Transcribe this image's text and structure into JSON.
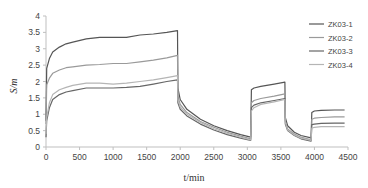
{
  "chart_data": {
    "type": "line",
    "title": "",
    "xlabel": "t/min",
    "ylabel": "S/m",
    "xlim": [
      0,
      4500
    ],
    "ylim": [
      0,
      4
    ],
    "xticks": [
      0,
      500,
      1000,
      1500,
      2000,
      2500,
      3000,
      3500,
      4000,
      4500
    ],
    "yticks": [
      0,
      0.5,
      1,
      1.5,
      2,
      2.5,
      3,
      3.5,
      4
    ],
    "grid": false,
    "legend_position": "right-top",
    "series": [
      {
        "name": "ZK03-1",
        "color": "#555555",
        "x": [
          0,
          10,
          50,
          100,
          200,
          300,
          400,
          600,
          800,
          1000,
          1200,
          1400,
          1600,
          1800,
          1960,
          1965,
          2000,
          2100,
          2300,
          2500,
          2700,
          2900,
          3050,
          3060,
          3100,
          3200,
          3400,
          3560,
          3565,
          3600,
          3700,
          3800,
          3950,
          3960,
          4000,
          4100,
          4300,
          4450
        ],
        "y": [
          0.8,
          2.4,
          2.7,
          2.9,
          3.05,
          3.15,
          3.2,
          3.3,
          3.35,
          3.35,
          3.35,
          3.42,
          3.45,
          3.5,
          3.55,
          1.8,
          1.45,
          1.15,
          0.85,
          0.65,
          0.5,
          0.38,
          0.3,
          1.75,
          1.8,
          1.85,
          1.92,
          1.98,
          0.9,
          0.65,
          0.45,
          0.35,
          0.28,
          1.05,
          1.1,
          1.12,
          1.13,
          1.13
        ]
      },
      {
        "name": "ZK03-2",
        "color": "#9a9a9a",
        "x": [
          0,
          10,
          50,
          100,
          200,
          300,
          400,
          600,
          800,
          1000,
          1200,
          1400,
          1600,
          1800,
          1960,
          1965,
          2000,
          2100,
          2300,
          2500,
          2700,
          2900,
          3050,
          3060,
          3100,
          3200,
          3400,
          3560,
          3565,
          3600,
          3700,
          3800,
          3950,
          3960,
          4000,
          4100,
          4300,
          4450
        ],
        "y": [
          0.7,
          1.9,
          2.1,
          2.25,
          2.35,
          2.42,
          2.45,
          2.5,
          2.52,
          2.55,
          2.55,
          2.6,
          2.65,
          2.72,
          2.8,
          1.55,
          1.3,
          1.05,
          0.78,
          0.6,
          0.45,
          0.33,
          0.25,
          1.35,
          1.42,
          1.48,
          1.55,
          1.62,
          0.8,
          0.55,
          0.4,
          0.3,
          0.22,
          0.85,
          0.88,
          0.9,
          0.92,
          0.92
        ]
      },
      {
        "name": "ZK03-3",
        "color": "#666666",
        "x": [
          0,
          10,
          50,
          100,
          200,
          300,
          400,
          600,
          800,
          1000,
          1200,
          1400,
          1600,
          1800,
          1960,
          1965,
          2000,
          2100,
          2300,
          2500,
          2700,
          2900,
          3050,
          3060,
          3100,
          3200,
          3400,
          3560,
          3565,
          3600,
          3700,
          3800,
          3950,
          3960,
          4000,
          4100,
          4300,
          4450
        ],
        "y": [
          0.3,
          0.8,
          1.2,
          1.45,
          1.6,
          1.68,
          1.72,
          1.8,
          1.8,
          1.8,
          1.82,
          1.85,
          1.92,
          2.0,
          2.05,
          1.35,
          1.15,
          0.95,
          0.7,
          0.52,
          0.38,
          0.27,
          0.2,
          1.2,
          1.28,
          1.35,
          1.42,
          1.48,
          0.7,
          0.5,
          0.35,
          0.25,
          0.18,
          0.68,
          0.7,
          0.72,
          0.73,
          0.73
        ]
      },
      {
        "name": "ZK03-4",
        "color": "#b5b5b5",
        "x": [
          0,
          10,
          50,
          100,
          200,
          300,
          400,
          600,
          800,
          1000,
          1200,
          1400,
          1600,
          1800,
          1960,
          1965,
          2000,
          2100,
          2300,
          2500,
          2700,
          2900,
          3050,
          3060,
          3100,
          3200,
          3400,
          3560,
          3565,
          3600,
          3700,
          3800,
          3950,
          3960,
          4000,
          4100,
          4300,
          4450
        ],
        "y": [
          0.4,
          0.9,
          1.35,
          1.6,
          1.75,
          1.82,
          1.88,
          1.95,
          1.95,
          1.92,
          1.95,
          2.0,
          2.05,
          2.12,
          2.18,
          1.45,
          1.22,
          1.0,
          0.75,
          0.56,
          0.42,
          0.3,
          0.22,
          1.1,
          1.2,
          1.3,
          1.38,
          1.45,
          0.75,
          0.52,
          0.37,
          0.27,
          0.2,
          0.58,
          0.6,
          0.62,
          0.62,
          0.62
        ]
      }
    ]
  },
  "plot": {
    "left": 46,
    "right": 348,
    "top": 16,
    "bottom": 147
  },
  "axis_color": "#bfbfbf"
}
